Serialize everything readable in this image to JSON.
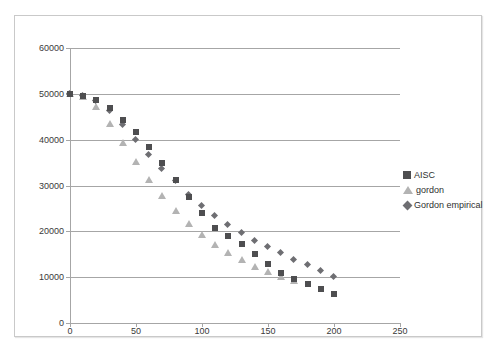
{
  "chart_data": {
    "type": "scatter",
    "title": "",
    "subtitle": "",
    "xlabel": "",
    "ylabel": "",
    "xlim": [
      0,
      250
    ],
    "ylim": [
      0,
      60000
    ],
    "xticks": [
      0,
      50,
      100,
      150,
      200,
      250
    ],
    "yticks": [
      0,
      10000,
      20000,
      30000,
      40000,
      50000,
      60000
    ],
    "xtick_labels": [
      "0",
      "50",
      "100",
      "150",
      "200",
      "250"
    ],
    "ytick_labels": [
      "0",
      "10000",
      "20000",
      "30000",
      "40000",
      "50000",
      "60000"
    ],
    "grid": "horizontal",
    "legend_position": "right",
    "series": [
      {
        "name": "AISC",
        "marker": "square",
        "color": "#4e4e50",
        "points": [
          [
            0,
            50000
          ],
          [
            10,
            49600
          ],
          [
            20,
            48700
          ],
          [
            30,
            46900
          ],
          [
            40,
            44300
          ],
          [
            50,
            41600
          ],
          [
            60,
            38500
          ],
          [
            70,
            35000
          ],
          [
            80,
            31100
          ],
          [
            90,
            27500
          ],
          [
            100,
            23900
          ],
          [
            110,
            20700
          ],
          [
            120,
            19000
          ],
          [
            130,
            17300
          ],
          [
            140,
            15000
          ],
          [
            150,
            12900
          ],
          [
            160,
            11000
          ],
          [
            170,
            9600
          ],
          [
            180,
            8500
          ],
          [
            190,
            7400
          ],
          [
            200,
            6400
          ]
        ]
      },
      {
        "name": "gordon",
        "marker": "triangle",
        "color": "#b3b3b3",
        "points": [
          [
            0,
            50000
          ],
          [
            10,
            49300
          ],
          [
            20,
            47200
          ],
          [
            30,
            43400
          ],
          [
            40,
            39300
          ],
          [
            50,
            35200
          ],
          [
            60,
            31300
          ],
          [
            70,
            27700
          ],
          [
            80,
            24500
          ],
          [
            90,
            21700
          ],
          [
            100,
            19200
          ],
          [
            110,
            17100
          ],
          [
            120,
            15300
          ],
          [
            130,
            13700
          ],
          [
            140,
            12300
          ],
          [
            150,
            11100
          ],
          [
            160,
            10100
          ],
          [
            170,
            9200
          ]
        ]
      },
      {
        "name": "Gordon empirical",
        "marker": "diamond",
        "color": "#6e6e72",
        "points": [
          [
            0,
            50000
          ],
          [
            10,
            49500
          ],
          [
            20,
            48500
          ],
          [
            30,
            46300
          ],
          [
            40,
            43200
          ],
          [
            50,
            40000
          ],
          [
            60,
            36700
          ],
          [
            70,
            33600
          ],
          [
            80,
            30900
          ],
          [
            90,
            28000
          ],
          [
            100,
            25600
          ],
          [
            110,
            23300
          ],
          [
            120,
            21400
          ],
          [
            130,
            19600
          ],
          [
            140,
            18000
          ],
          [
            150,
            16500
          ],
          [
            160,
            15200
          ],
          [
            170,
            13700
          ],
          [
            180,
            12600
          ],
          [
            190,
            11400
          ],
          [
            200,
            10000
          ]
        ]
      }
    ]
  },
  "legend": {
    "items": [
      {
        "label": "AISC",
        "marker": "square"
      },
      {
        "label": "gordon",
        "marker": "triangle"
      },
      {
        "label": "Gordon empirical",
        "marker": "diamond"
      }
    ]
  },
  "colors": {
    "series_aisc": "#4e4e50",
    "series_gordon": "#b3b3b3",
    "series_gordon_empirical": "#6e6e72",
    "gridline": "#a6a6a6",
    "frame_border": "#c9c9c9",
    "background": "#ffffff",
    "tick_text": "#3a3a3a"
  }
}
